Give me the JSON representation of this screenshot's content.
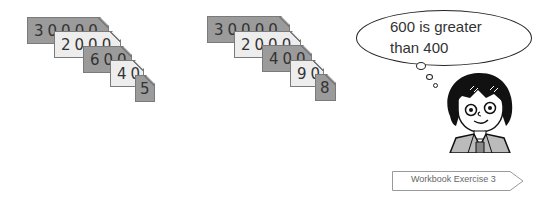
{
  "card_sets": [
    {
      "cards": [
        {
          "value": "30000",
          "shade": "dark"
        },
        {
          "value": "2000",
          "shade": "light"
        },
        {
          "value": "600",
          "shade": "dark"
        },
        {
          "value": "40",
          "shade": "light"
        },
        {
          "value": "5",
          "shade": "dark"
        }
      ]
    },
    {
      "cards": [
        {
          "value": "30000",
          "shade": "dark"
        },
        {
          "value": "2000",
          "shade": "light"
        },
        {
          "value": "400",
          "shade": "dark"
        },
        {
          "value": "90",
          "shade": "light"
        },
        {
          "value": "8",
          "shade": "dark"
        }
      ]
    }
  ],
  "thought_bubble": {
    "line1": "600 is greater",
    "line2": "than 400"
  },
  "character": {
    "icon": "girl-thinking-illustration"
  },
  "workbook_link": {
    "label": "Workbook Exercise 3"
  },
  "colors": {
    "dark_card": "#9b9b9b",
    "light_card": "#ededed",
    "border": "#7a7a7a",
    "text": "#333333"
  }
}
